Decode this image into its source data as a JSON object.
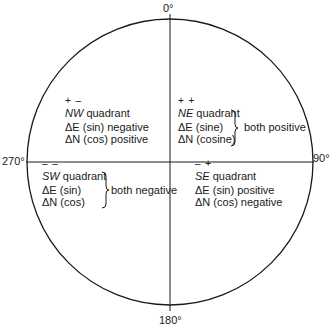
{
  "axes": {
    "top": "0°",
    "right": "90°",
    "bottom": "180°",
    "left": "270°"
  },
  "quadrants": {
    "NW": {
      "signs": "+ –",
      "abbr": "NW",
      "name": " quadrant",
      "line1": "ΔE (sin) negative",
      "line2": "ΔN (cos) positive"
    },
    "NE": {
      "signs": "+ +",
      "abbr": "NE",
      "name": " quadrant",
      "line1": "ΔE (sine)",
      "line2": "ΔN (cosine)",
      "brace_label": "both positive"
    },
    "SW": {
      "signs": "– –",
      "abbr": "SW",
      "name": " quadrant",
      "line1": "ΔE (sin)",
      "line2": "ΔN (cos)",
      "brace_label": "both negative"
    },
    "SE": {
      "signs": "– +",
      "abbr": "SE",
      "name": " quadrant",
      "line1": "ΔE (sin) positive",
      "line2": "ΔN (cos) negative"
    }
  },
  "colors": {
    "stroke": "#1a1a1a",
    "background": "#ffffff"
  }
}
